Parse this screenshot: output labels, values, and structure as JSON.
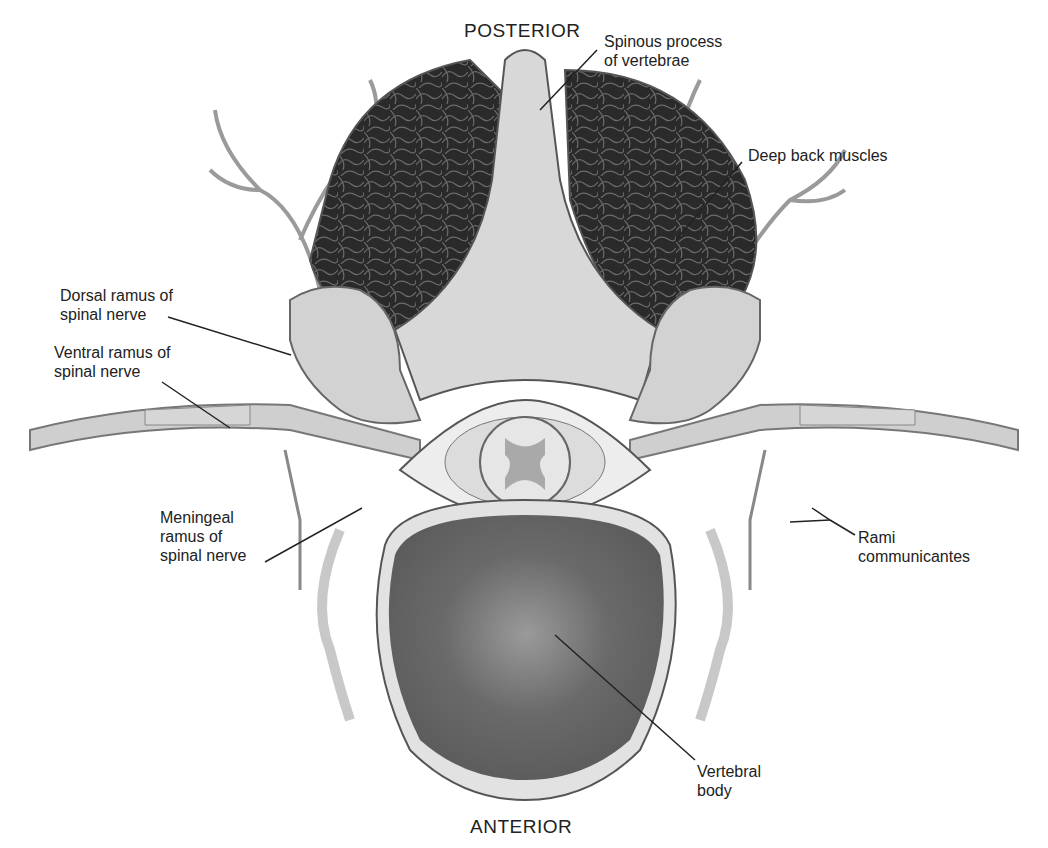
{
  "figure": {
    "orientation": {
      "top": "POSTERIOR",
      "bottom": "ANTERIOR"
    },
    "labels": [
      {
        "id": "spinous",
        "lines": [
          "Spinous process",
          "of vertebrae"
        ]
      },
      {
        "id": "deep-back",
        "lines": [
          "Deep back muscles"
        ]
      },
      {
        "id": "dorsal",
        "lines": [
          "Dorsal ramus of",
          "spinal nerve"
        ]
      },
      {
        "id": "ventral",
        "lines": [
          "Ventral ramus of",
          "spinal nerve"
        ]
      },
      {
        "id": "meningeal",
        "lines": [
          "Meningeal",
          "ramus of",
          "spinal nerve"
        ]
      },
      {
        "id": "rami",
        "lines": [
          "Rami",
          "communicantes"
        ]
      },
      {
        "id": "body",
        "lines": [
          "Vertebral",
          "body"
        ]
      }
    ],
    "colors": {
      "muscle": "#2b2b2b",
      "bone": "#d6d6d6",
      "nerve": "#c9c9c9",
      "body_core": "#6e6e6e",
      "outline": "#555555"
    }
  }
}
